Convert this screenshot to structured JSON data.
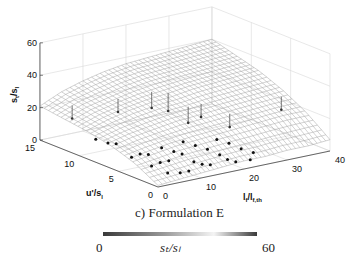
{
  "chart_data": {
    "type": "surface3d",
    "title": "c) Formulation E",
    "xlabel": "l_f/l_f,th",
    "ylabel": "u'/s_l",
    "zlabel": "s_t/s_l",
    "xlim": [
      0,
      40
    ],
    "ylim": [
      0,
      15
    ],
    "zlim": [
      0,
      60
    ],
    "xticks": [
      0,
      10,
      20,
      30,
      40
    ],
    "yticks": [
      0,
      5,
      10,
      15
    ],
    "zticks": [
      0,
      20,
      40,
      60
    ],
    "grid": true,
    "surface": {
      "description": "fitted surface s_t/s_l = f(l_f/l_f,th, u'/s_l), increasing with u'/s_l and l_f/l_f,th",
      "x_samples": [
        0,
        5,
        10,
        15,
        20,
        25,
        30,
        35,
        40
      ],
      "y_samples": [
        0,
        3,
        6,
        9,
        12,
        15
      ],
      "z_grid": [
        [
          1,
          2,
          3,
          4,
          5,
          5,
          6,
          6,
          7
        ],
        [
          9,
          11,
          13,
          14,
          15,
          16,
          17,
          18,
          18
        ],
        [
          14,
          17,
          19,
          21,
          22,
          23,
          24,
          25,
          26
        ],
        [
          17,
          21,
          24,
          26,
          27,
          29,
          30,
          31,
          32
        ],
        [
          19,
          24,
          27,
          30,
          32,
          33,
          34,
          35,
          36
        ],
        [
          21,
          27,
          31,
          34,
          36,
          37,
          38,
          39,
          40
        ]
      ]
    },
    "points": [
      {
        "x": 2,
        "y": 9,
        "z": 11
      },
      {
        "x": 3,
        "y": 8,
        "z": 10
      },
      {
        "x": 4,
        "y": 7.5,
        "z": 10
      },
      {
        "x": 3,
        "y": 5,
        "z": 7
      },
      {
        "x": 5,
        "y": 5,
        "z": 8
      },
      {
        "x": 6,
        "y": 4.5,
        "z": 8
      },
      {
        "x": 4,
        "y": 3,
        "z": 5
      },
      {
        "x": 6,
        "y": 3,
        "z": 6
      },
      {
        "x": 8,
        "y": 3,
        "z": 6
      },
      {
        "x": 5,
        "y": 1.5,
        "z": 3
      },
      {
        "x": 7,
        "y": 1,
        "z": 3
      },
      {
        "x": 9,
        "y": 1,
        "z": 3
      },
      {
        "x": 10,
        "y": 5,
        "z": 9
      },
      {
        "x": 11,
        "y": 4,
        "z": 8
      },
      {
        "x": 12,
        "y": 3.5,
        "z": 7
      },
      {
        "x": 12,
        "y": 2,
        "z": 5
      },
      {
        "x": 13,
        "y": 1.5,
        "z": 4
      },
      {
        "x": 14,
        "y": 1,
        "z": 4
      },
      {
        "x": 15,
        "y": 5,
        "z": 10
      },
      {
        "x": 16,
        "y": 4,
        "z": 9
      },
      {
        "x": 17,
        "y": 3,
        "z": 8
      },
      {
        "x": 18,
        "y": 2,
        "z": 6
      },
      {
        "x": 18,
        "y": 1,
        "z": 5
      },
      {
        "x": 19,
        "y": 0.5,
        "z": 4
      },
      {
        "x": 21,
        "y": 4,
        "z": 10
      },
      {
        "x": 22,
        "y": 3,
        "z": 9
      },
      {
        "x": 23,
        "y": 2,
        "z": 7
      },
      {
        "x": 24,
        "y": 1,
        "z": 6
      },
      {
        "x": 22,
        "y": 0.3,
        "z": 4
      }
    ],
    "stems": [
      {
        "x": 2,
        "y": 12,
        "z0": 26,
        "z1": 18
      },
      {
        "x": 9,
        "y": 10,
        "z0": 30,
        "z1": 22
      },
      {
        "x": 15,
        "y": 9,
        "z0": 33,
        "z1": 23
      },
      {
        "x": 17,
        "y": 8,
        "z0": 33,
        "z1": 22
      },
      {
        "x": 18,
        "y": 6,
        "z0": 28,
        "z1": 18
      },
      {
        "x": 21,
        "y": 6,
        "z0": 28,
        "z1": 20
      },
      {
        "x": 24,
        "y": 4,
        "z0": 24,
        "z1": 16
      },
      {
        "x": 36,
        "y": 4,
        "z0": 28,
        "z1": 20
      }
    ],
    "colorbar": {
      "label": "s_t/s_l",
      "min": 0,
      "max": 60,
      "orientation": "horizontal",
      "colors": [
        "#3a3a3a",
        "#9a9a9a",
        "#f4f4f4",
        "#3a3a3a"
      ]
    }
  },
  "labels": {
    "caption": "c) Formulation E",
    "colorbar_min": "0",
    "colorbar_max": "60",
    "colorbar_title": "sₜ/sₗ",
    "zlabel": "s",
    "zlabel_sub_t": "t",
    "zlabel_den": "/s",
    "zlabel_sub_l": "l",
    "ylabel": "u'/s",
    "ylabel_sub": "l",
    "xlabel": "l",
    "xlabel_sub1": "f",
    "xlabel_mid": "/l",
    "xlabel_sub2": "f,th"
  }
}
